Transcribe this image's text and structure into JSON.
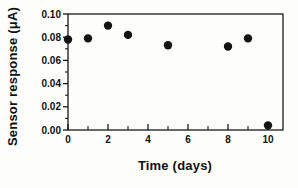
{
  "chart_data": {
    "type": "scatter",
    "title": "",
    "xlabel": "Time (days)",
    "ylabel": "Sensor response (μA)",
    "xlim": [
      0,
      10.75
    ],
    "ylim": [
      0,
      0.1
    ],
    "grid": false,
    "legend": "none",
    "marker": "filled-circle",
    "x_axis": {
      "label": "Time (days)",
      "major_ticks": [
        {
          "value": 0,
          "label": "0"
        },
        {
          "value": 2,
          "label": "2"
        },
        {
          "value": 4,
          "label": "4"
        },
        {
          "value": 6,
          "label": "6"
        },
        {
          "value": 8,
          "label": "8"
        },
        {
          "value": 10,
          "label": "10"
        }
      ],
      "minor_ticks": [
        1,
        3,
        5,
        7,
        9
      ]
    },
    "y_axis": {
      "label": "Sensor response (μA)",
      "major_ticks": [
        {
          "value": 0.0,
          "label": "0.00"
        },
        {
          "value": 0.02,
          "label": "0.02"
        },
        {
          "value": 0.04,
          "label": "0.04"
        },
        {
          "value": 0.06,
          "label": "0.06"
        },
        {
          "value": 0.08,
          "label": "0.08"
        },
        {
          "value": 0.1,
          "label": "0.10"
        }
      ],
      "minor_ticks": [
        0.01,
        0.03,
        0.05,
        0.07,
        0.09
      ]
    },
    "series": [
      {
        "name": "sensor-response",
        "points": [
          {
            "x": 0,
            "y": 0.078
          },
          {
            "x": 1,
            "y": 0.079
          },
          {
            "x": 2,
            "y": 0.09
          },
          {
            "x": 3,
            "y": 0.082
          },
          {
            "x": 5,
            "y": 0.073
          },
          {
            "x": 8,
            "y": 0.072
          },
          {
            "x": 9,
            "y": 0.079
          },
          {
            "x": 10,
            "y": 0.004
          }
        ]
      }
    ]
  },
  "colors": {
    "marker": "#141414",
    "axis": "#1a1a1a",
    "text": "#111111",
    "background": "#fdfdfb"
  }
}
